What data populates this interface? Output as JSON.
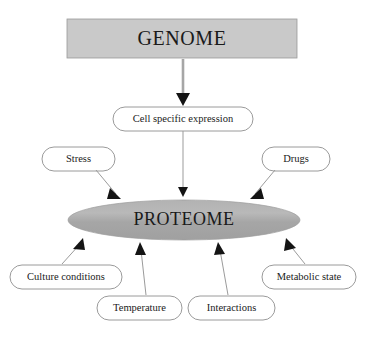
{
  "diagram": {
    "title_node": {
      "label": "GENOME",
      "shape": "rectangle",
      "fill": "#c9c9c9"
    },
    "expression_node": {
      "label": "Cell specific expression",
      "shape": "rounded-rectangle",
      "fill": "#ffffff"
    },
    "central_node": {
      "label": "PROTEOME",
      "shape": "ellipse",
      "fill": "#a9a9a9"
    },
    "influences": [
      {
        "label": "Stress",
        "position": "upper-left"
      },
      {
        "label": "Drugs",
        "position": "upper-right"
      },
      {
        "label": "Culture conditions",
        "position": "lower-left"
      },
      {
        "label": "Temperature",
        "position": "bottom-left-center"
      },
      {
        "label": "Interactions",
        "position": "bottom-right-center"
      },
      {
        "label": "Metabolic state",
        "position": "lower-right"
      }
    ],
    "colors": {
      "genome_fill": "#c9c9c9",
      "proteome_fill": "#a9a9a9",
      "node_stroke": "#8e8e8e",
      "connector": "#9b9b9b",
      "arrowhead": "#141414",
      "text": "#1a1a1a",
      "background": "#ffffff"
    }
  }
}
